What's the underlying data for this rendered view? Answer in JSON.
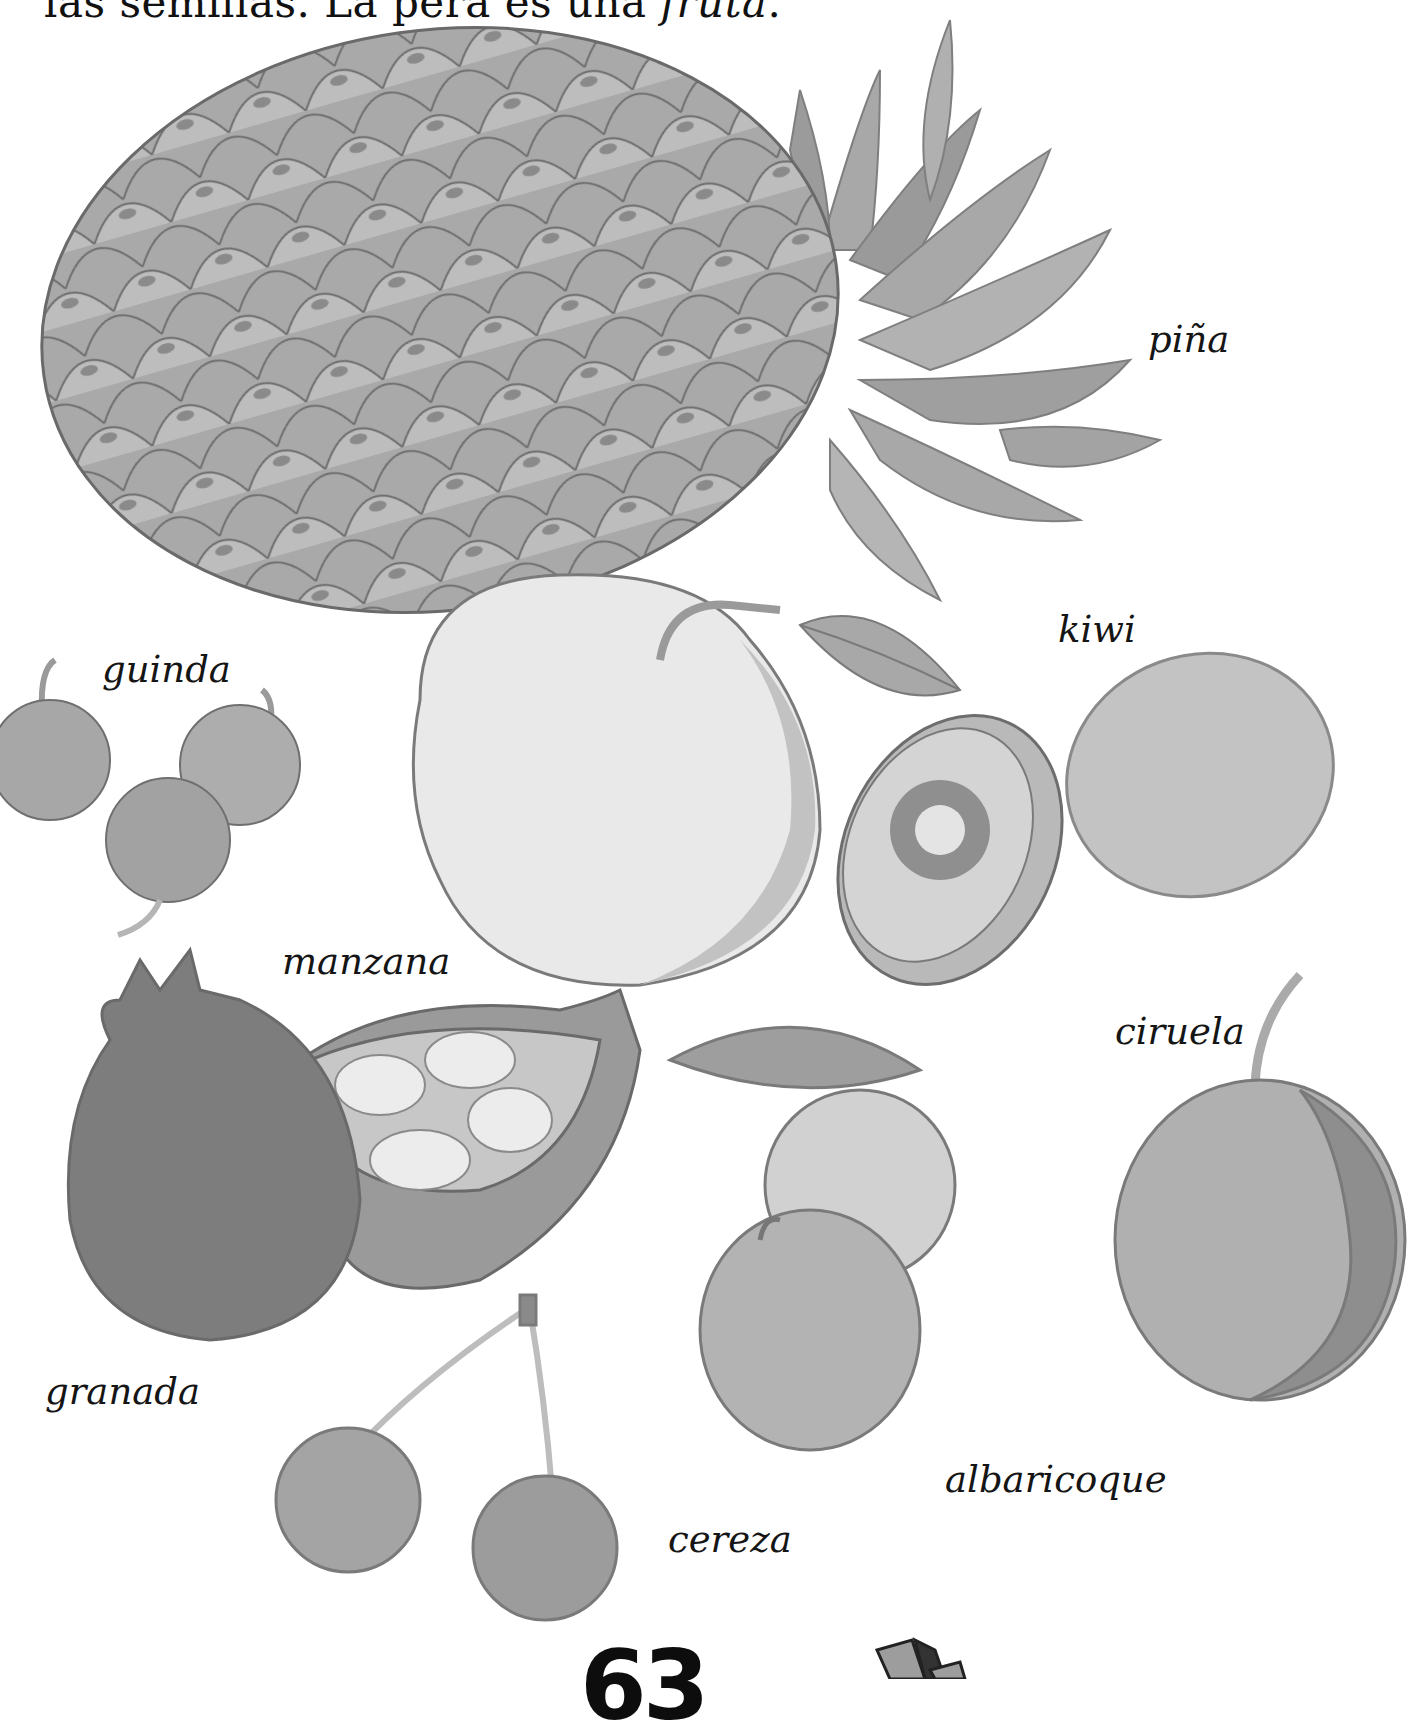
{
  "page": {
    "intro_text_prefix": "las semillas. La pera es una ",
    "intro_text_emphasis": "fruta",
    "intro_text_suffix": ".",
    "page_number": "63"
  },
  "labels": {
    "pina": "piña",
    "kiwi": "kiwi",
    "guinda": "guinda",
    "manzana": "manzana",
    "ciruela": "ciruela",
    "granada": "granada",
    "albaricoque": "albaricoque",
    "cereza": "cereza"
  },
  "icons": {
    "fruits": [
      "pineapple-illustration",
      "apple-illustration",
      "kiwi-illustration",
      "sour-cherry-illustration",
      "pomegranate-illustration",
      "apricot-illustration",
      "plum-illustration",
      "cherry-illustration"
    ],
    "corner": "book-stack-icon"
  },
  "colors": {
    "text": "#151515",
    "dark_gray": "#7a7a7a",
    "mid_gray": "#9d9d9d",
    "light_gray": "#c8c8c8",
    "paper": "#ffffff"
  }
}
